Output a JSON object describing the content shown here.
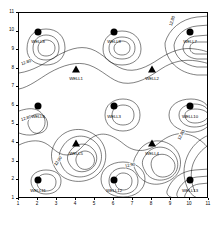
{
  "chart_data": {
    "type": "contour",
    "title": "",
    "xlabel": "",
    "ylabel": "",
    "xlim": [
      1,
      11
    ],
    "ylim": [
      1,
      11
    ],
    "xticks": [
      "1",
      "2",
      "3",
      "4",
      "5",
      "6",
      "7",
      "8",
      "9",
      "10",
      "11"
    ],
    "yticks": [
      "1",
      "2",
      "3",
      "4",
      "5",
      "6",
      "7",
      "8",
      "9",
      "10",
      "11"
    ],
    "grid": false,
    "legend": "none",
    "contour_interval": 0.1,
    "contour_levels": [
      "12.70",
      "12.80",
      "12.90",
      "13.00"
    ],
    "contour_labels": [
      {
        "text": "12.80",
        "x": 1.35,
        "y": 8.35,
        "rotation": -20
      },
      {
        "text": "12.80",
        "x": 1.35,
        "y": 5.35,
        "rotation": -18
      },
      {
        "text": "12.80",
        "x": 9.55,
        "y": 4.45,
        "rotation": -62
      },
      {
        "text": "12.80",
        "x": 9.05,
        "y": 10.55,
        "rotation": -72
      },
      {
        "text": "12.90",
        "x": 3.05,
        "y": 3.05,
        "rotation": -55
      },
      {
        "text": "12.90",
        "x": 6.85,
        "y": 2.85,
        "rotation": -12
      }
    ],
    "points": [
      {
        "label": "WELL8",
        "x": 2,
        "y": 10,
        "marker": "circle",
        "label_dx": 0,
        "label_dy": -0.52
      },
      {
        "label": "WELL9",
        "x": 6,
        "y": 10,
        "marker": "circle",
        "label_dx": 0,
        "label_dy": -0.52
      },
      {
        "label": "WELL7",
        "x": 10,
        "y": 10,
        "marker": "circle",
        "label_dx": 0,
        "label_dy": -0.52
      },
      {
        "label": "WELL1",
        "x": 4,
        "y": 8,
        "marker": "triangle",
        "label_dx": 0,
        "label_dy": -0.52
      },
      {
        "label": "WELL2",
        "x": 8,
        "y": 8,
        "marker": "triangle",
        "label_dx": 0,
        "label_dy": -0.52
      },
      {
        "label": "WELL6",
        "x": 2,
        "y": 6,
        "marker": "circle",
        "label_dx": 0,
        "label_dy": -0.52
      },
      {
        "label": "WELL3",
        "x": 6,
        "y": 6,
        "marker": "circle",
        "label_dx": 0,
        "label_dy": -0.52
      },
      {
        "label": "WELL10",
        "x": 10,
        "y": 6,
        "marker": "circle",
        "label_dx": 0,
        "label_dy": -0.52
      },
      {
        "label": "WELL5",
        "x": 4,
        "y": 4,
        "marker": "triangle",
        "label_dx": 0,
        "label_dy": -0.52
      },
      {
        "label": "WELL4",
        "x": 8,
        "y": 4,
        "marker": "triangle",
        "label_dx": 0,
        "label_dy": -0.52
      },
      {
        "label": "WELL11",
        "x": 2,
        "y": 2,
        "marker": "circle",
        "label_dx": 0,
        "label_dy": -0.52
      },
      {
        "label": "WELL12",
        "x": 6,
        "y": 2,
        "marker": "circle",
        "label_dx": 0,
        "label_dy": -0.52
      },
      {
        "label": "WELL13",
        "x": 10,
        "y": 2,
        "marker": "circle",
        "label_dx": 0,
        "label_dy": -0.52
      }
    ]
  },
  "style": {
    "line_color": "#000000",
    "marker_color": "#000000",
    "background": "#ffffff"
  }
}
